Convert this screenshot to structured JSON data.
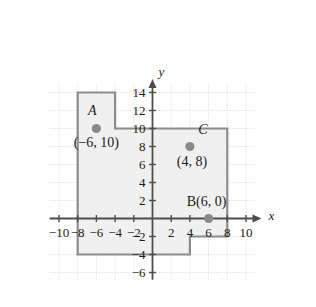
{
  "figure": {
    "type": "coordinate-plane-diagram",
    "background_color": "#ffffff",
    "axis_color": "#4d4d4d",
    "grid_color": "#d8d8d8",
    "polygon_fill": "#f0f0f0",
    "polygon_stroke": "#8c8c8c",
    "point_color": "#8a8a8a",
    "text_color": "#1a1a1a"
  },
  "axes": {
    "x_label": "x",
    "y_label": "y",
    "x_ticks": [
      "-10",
      "-8",
      "-6",
      "-4",
      "-2",
      "2",
      "4",
      "6",
      "8",
      "10"
    ],
    "x_tick_values": [
      -10,
      -8,
      -6,
      -4,
      -2,
      2,
      4,
      6,
      8,
      10
    ],
    "y_ticks": [
      "14",
      "12",
      "10",
      "8",
      "6",
      "4",
      "2",
      "-2",
      "-4",
      "-6"
    ],
    "y_tick_values": [
      14,
      12,
      10,
      8,
      6,
      4,
      2,
      -2,
      -4,
      -6
    ],
    "x_range": [
      -11,
      11
    ],
    "y_range": [
      -7,
      15
    ]
  },
  "chart_data": {
    "type": "scatter",
    "title": "",
    "xlabel": "x",
    "ylabel": "y",
    "xlim": [
      -11,
      11
    ],
    "ylim": [
      -7,
      15
    ],
    "grid": true,
    "points": [
      {
        "name": "A",
        "label": "A",
        "coord_text": "(−6, 10)",
        "x": -6,
        "y": 10,
        "label_dx": -4,
        "label_dy": -14,
        "coord_dx": 0,
        "coord_dy": 18
      },
      {
        "name": "C",
        "label": "C",
        "coord_text": "(4, 8)",
        "x": 4,
        "y": 8,
        "label_dx": 13,
        "label_dy": -13,
        "coord_dx": 2,
        "coord_dy": 19
      },
      {
        "name": "B",
        "label": "",
        "coord_text": "B(6, 0)",
        "x": 6,
        "y": 0,
        "label_dx": 0,
        "label_dy": 0,
        "coord_dx": -2,
        "coord_dy": -13
      }
    ],
    "shapes": [
      {
        "name": "shaded-region",
        "kind": "polygon",
        "vertices": [
          [
            -8,
            14
          ],
          [
            -4,
            14
          ],
          [
            -4,
            10
          ],
          [
            8,
            10
          ],
          [
            8,
            -2
          ],
          [
            4,
            -2
          ],
          [
            4,
            -4
          ],
          [
            -8,
            -4
          ]
        ]
      }
    ]
  }
}
